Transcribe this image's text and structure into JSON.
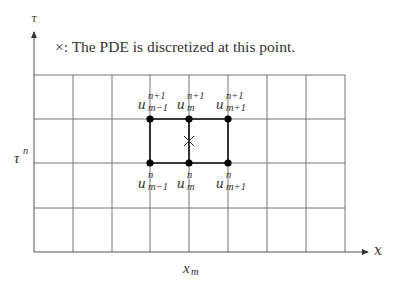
{
  "diagram": {
    "caption": "×: The PDE is discretized at this point.",
    "axes": {
      "vertical_label": "τ",
      "horizontal_label": "x",
      "row_label_base": "τ",
      "row_label_sup": "n",
      "col_label_base": "x",
      "col_label_sub": "m"
    },
    "grid": {
      "columns": 8,
      "rows": 4,
      "x_lines": [
        34,
        73,
        112,
        150,
        189,
        228,
        267,
        306,
        345
      ],
      "y_lines": [
        75,
        119,
        163,
        208,
        252
      ]
    },
    "stencil_nodes": {
      "top": [
        {
          "base": "u",
          "sup": "n+1",
          "sub": "m−1"
        },
        {
          "base": "u",
          "sup": "n+1",
          "sub": "m"
        },
        {
          "base": "u",
          "sup": "n+1",
          "sub": "m+1"
        }
      ],
      "bottom": [
        {
          "base": "u",
          "sup": "n",
          "sub": "m−1"
        },
        {
          "base": "u",
          "sup": "n",
          "sub": "m"
        },
        {
          "base": "u",
          "sup": "n",
          "sub": "m+1"
        }
      ]
    },
    "marker": {
      "symbol": "×",
      "meaning": "discretization point"
    },
    "colors": {
      "grid": "#555555",
      "stencil": "#111111",
      "background": "#ffffff"
    }
  }
}
